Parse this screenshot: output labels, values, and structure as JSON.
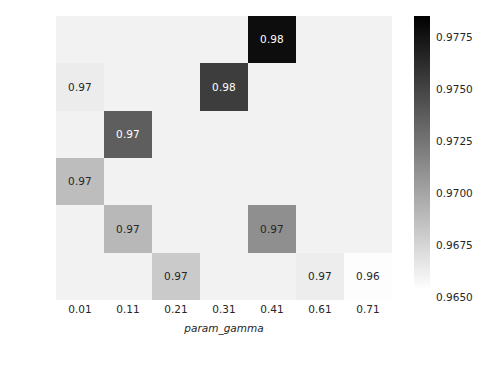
{
  "chart_data": {
    "type": "heatmap",
    "title": "",
    "xlabel": "param_gamma",
    "ylabel": "param_C",
    "x_tick_labels": [
      "0.01",
      "0.11",
      "0.21",
      "0.31",
      "0.41",
      "0.61",
      "0.71"
    ],
    "y_tick_labels": [
      "10",
      "15",
      "30",
      "35",
      "40",
      "45"
    ],
    "grid": false,
    "legend": "none",
    "colorbar": {
      "position": "right",
      "orientation": "vertical",
      "tick_labels": [
        "0.9775",
        "0.9750",
        "0.9725",
        "0.9700",
        "0.9675",
        "0.9650"
      ],
      "tick_values": [
        0.9775,
        0.975,
        0.9725,
        0.97,
        0.9675,
        0.965
      ],
      "vmin": 0.965,
      "vmax": 0.9785,
      "cmap": "gray_r",
      "low_color": "#ffffff",
      "high_color": "#000000"
    },
    "cell_colors": {
      "blank": "#f2f2f2",
      "v0965": "#fdfdfd",
      "v0968": "#f0f0f0",
      "v0970": "#cacaca",
      "v0971": "#bdbdbd",
      "v0972": "#b0b0b0",
      "v0973": "#8f8f8f",
      "v0975": "#5e5e5e",
      "v0977": "#3d3d3d",
      "v0978": "#0d0d0d"
    },
    "rows": [
      {
        "y": "10",
        "cells": [
          {
            "x": "0.01",
            "label": "",
            "color": "#f2f2f2",
            "text_color": "#262626"
          },
          {
            "x": "0.11",
            "label": "",
            "color": "#f2f2f2",
            "text_color": "#262626"
          },
          {
            "x": "0.21",
            "label": "",
            "color": "#f2f2f2",
            "text_color": "#262626"
          },
          {
            "x": "0.31",
            "label": "",
            "color": "#f2f2f2",
            "text_color": "#262626"
          },
          {
            "x": "0.41",
            "label": "0.98",
            "color": "#0d0d0d",
            "text_color": "#ffffff"
          },
          {
            "x": "0.61",
            "label": "",
            "color": "#f2f2f2",
            "text_color": "#262626"
          },
          {
            "x": "0.71",
            "label": "",
            "color": "#f2f2f2",
            "text_color": "#262626"
          }
        ]
      },
      {
        "y": "15",
        "cells": [
          {
            "x": "0.01",
            "label": "0.97",
            "color": "#ececec",
            "text_color": "#262626"
          },
          {
            "x": "0.11",
            "label": "",
            "color": "#f2f2f2",
            "text_color": "#262626"
          },
          {
            "x": "0.21",
            "label": "",
            "color": "#f2f2f2",
            "text_color": "#262626"
          },
          {
            "x": "0.31",
            "label": "0.98",
            "color": "#3d3d3d",
            "text_color": "#ffffff"
          },
          {
            "x": "0.41",
            "label": "",
            "color": "#f2f2f2",
            "text_color": "#262626"
          },
          {
            "x": "0.61",
            "label": "",
            "color": "#f2f2f2",
            "text_color": "#262626"
          },
          {
            "x": "0.71",
            "label": "",
            "color": "#f2f2f2",
            "text_color": "#262626"
          }
        ]
      },
      {
        "y": "30",
        "cells": [
          {
            "x": "0.01",
            "label": "",
            "color": "#f2f2f2",
            "text_color": "#262626"
          },
          {
            "x": "0.11",
            "label": "0.97",
            "color": "#5e5e5e",
            "text_color": "#ffffff"
          },
          {
            "x": "0.21",
            "label": "",
            "color": "#f2f2f2",
            "text_color": "#262626"
          },
          {
            "x": "0.31",
            "label": "",
            "color": "#f2f2f2",
            "text_color": "#262626"
          },
          {
            "x": "0.41",
            "label": "",
            "color": "#f2f2f2",
            "text_color": "#262626"
          },
          {
            "x": "0.61",
            "label": "",
            "color": "#f2f2f2",
            "text_color": "#262626"
          },
          {
            "x": "0.71",
            "label": "",
            "color": "#f2f2f2",
            "text_color": "#262626"
          }
        ]
      },
      {
        "y": "35",
        "cells": [
          {
            "x": "0.01",
            "label": "0.97",
            "color": "#bdbdbd",
            "text_color": "#262626"
          },
          {
            "x": "0.11",
            "label": "",
            "color": "#f2f2f2",
            "text_color": "#262626"
          },
          {
            "x": "0.21",
            "label": "",
            "color": "#f2f2f2",
            "text_color": "#262626"
          },
          {
            "x": "0.31",
            "label": "",
            "color": "#f2f2f2",
            "text_color": "#262626"
          },
          {
            "x": "0.41",
            "label": "",
            "color": "#f2f2f2",
            "text_color": "#262626"
          },
          {
            "x": "0.61",
            "label": "",
            "color": "#f2f2f2",
            "text_color": "#262626"
          },
          {
            "x": "0.71",
            "label": "",
            "color": "#f2f2f2",
            "text_color": "#262626"
          }
        ]
      },
      {
        "y": "40",
        "cells": [
          {
            "x": "0.01",
            "label": "",
            "color": "#f2f2f2",
            "text_color": "#262626"
          },
          {
            "x": "0.11",
            "label": "0.97",
            "color": "#b8b8b8",
            "text_color": "#262626"
          },
          {
            "x": "0.21",
            "label": "",
            "color": "#f2f2f2",
            "text_color": "#262626"
          },
          {
            "x": "0.31",
            "label": "",
            "color": "#f2f2f2",
            "text_color": "#262626"
          },
          {
            "x": "0.41",
            "label": "0.97",
            "color": "#8f8f8f",
            "text_color": "#262626"
          },
          {
            "x": "0.61",
            "label": "",
            "color": "#f2f2f2",
            "text_color": "#262626"
          },
          {
            "x": "0.71",
            "label": "",
            "color": "#f2f2f2",
            "text_color": "#262626"
          }
        ]
      },
      {
        "y": "45",
        "cells": [
          {
            "x": "0.01",
            "label": "",
            "color": "#f2f2f2",
            "text_color": "#262626"
          },
          {
            "x": "0.11",
            "label": "",
            "color": "#f2f2f2",
            "text_color": "#262626"
          },
          {
            "x": "0.21",
            "label": "0.97",
            "color": "#cacaca",
            "text_color": "#262626"
          },
          {
            "x": "0.31",
            "label": "",
            "color": "#f2f2f2",
            "text_color": "#262626"
          },
          {
            "x": "0.41",
            "label": "",
            "color": "#f2f2f2",
            "text_color": "#262626"
          },
          {
            "x": "0.61",
            "label": "0.97",
            "color": "#ededed",
            "text_color": "#262626"
          },
          {
            "x": "0.71",
            "label": "0.96",
            "color": "#fdfdfd",
            "text_color": "#262626"
          }
        ]
      }
    ]
  }
}
